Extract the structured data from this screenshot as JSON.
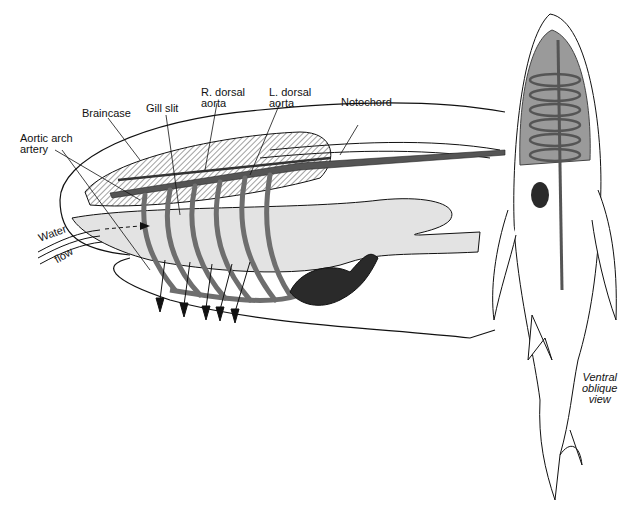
{
  "diagram": {
    "labels": {
      "aortic_arch": [
        "Aortic arch",
        "artery"
      ],
      "braincase": "Braincase",
      "gill_slit": "Gill slit",
      "r_dorsal_aorta": [
        "R. dorsal",
        "aorta"
      ],
      "l_dorsal_aorta": [
        "L. dorsal",
        "aorta"
      ],
      "notochord": "Notochord",
      "water": "Water",
      "flow": "flow",
      "view_caption": [
        "Ventral",
        "oblique",
        "view"
      ]
    },
    "colors": {
      "outline": "#111111",
      "vessel": "#6e6e6e",
      "pharynx": "#e3e3e3",
      "heart": "#2a2a2a",
      "body_fill": "#9a9a9a"
    }
  }
}
